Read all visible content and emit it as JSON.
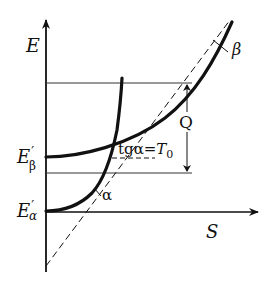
{
  "diagram": {
    "axes": {
      "y_label": "E",
      "x_label": "S"
    },
    "levels": {
      "e_beta": {
        "base": "E",
        "prime": "′",
        "sub": "β"
      },
      "e_alpha": {
        "base": "E",
        "prime": "′",
        "sub": "α"
      }
    },
    "curves": {
      "alpha_label": "α",
      "beta_label": "β"
    },
    "annotations": {
      "tangent_prefix": "tgα=",
      "tangent_T": "T",
      "tangent_sub": "0",
      "heat_label": "Q"
    },
    "colors": {
      "ink": "#111111",
      "background": "#ffffff"
    }
  }
}
